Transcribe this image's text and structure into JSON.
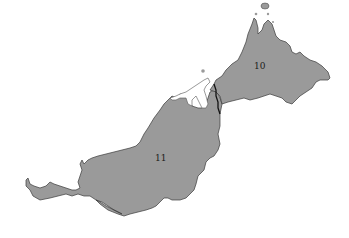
{
  "map": {
    "title": "",
    "fill_color": "#9a9a9a",
    "background_color": "#ffffff",
    "regions": [
      {
        "id": "sabah",
        "label": "10",
        "label_pos": [
          260,
          68
        ]
      },
      {
        "id": "sarawak",
        "label": "11",
        "label_pos": [
          160,
          160
        ]
      },
      {
        "id": "brunei",
        "label": "",
        "shaded": false
      }
    ]
  }
}
